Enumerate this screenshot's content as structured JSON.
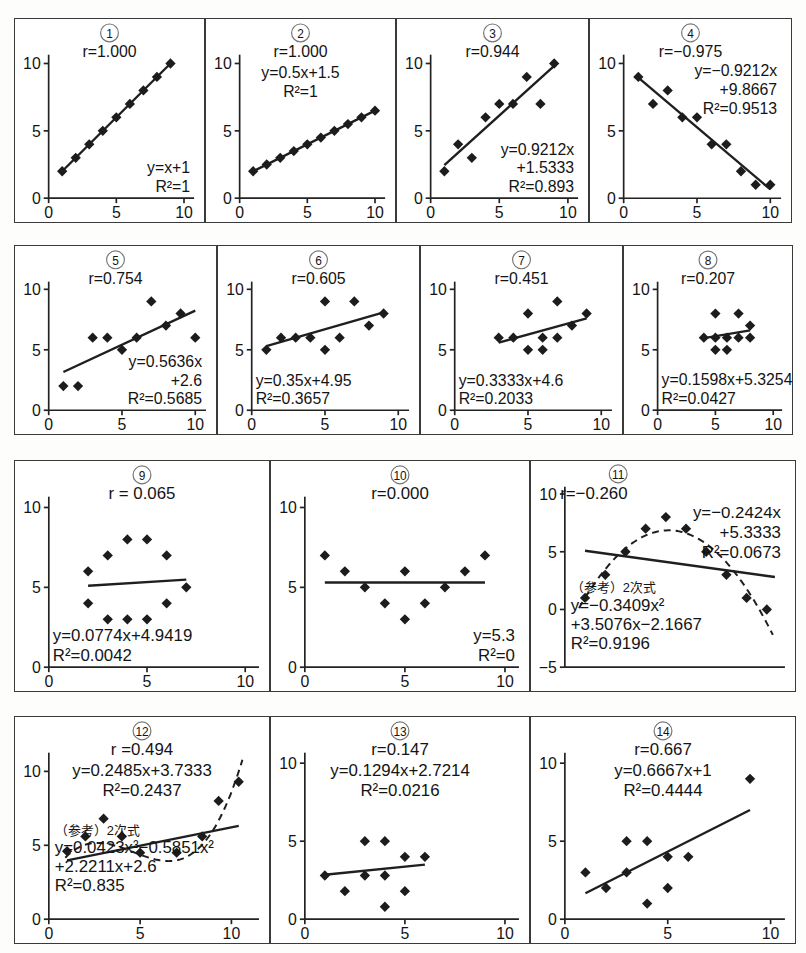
{
  "figure": {
    "point_color": "#1c1c1c",
    "line_color": "#1f1f1f",
    "axis_color": "#222222",
    "panel_border_color": "#3a3a3a",
    "background": "#ffffff",
    "axis_ticks_x": [
      "0",
      "5",
      "10"
    ],
    "axis_ticks_y": [
      "0",
      "5",
      "10"
    ],
    "axis_ticks_y_neg": [
      "-5",
      "0",
      "5",
      "10"
    ]
  },
  "rows": [
    {
      "top": 18,
      "height": 205,
      "panels": [
        0,
        1,
        2,
        3
      ]
    },
    {
      "top": 245,
      "height": 190,
      "panels": [
        4,
        5,
        6,
        7
      ]
    },
    {
      "top": 460,
      "height": 232,
      "panels": [
        8,
        9,
        10
      ]
    },
    {
      "top": 716,
      "height": 228,
      "panels": [
        11,
        12,
        13
      ]
    }
  ],
  "chart_data": [
    {
      "id": 1,
      "number_label": "①",
      "type": "scatter",
      "title": "r=1.000",
      "r": 1.0,
      "equation_lines": [
        "y=x+1",
        "R²=1"
      ],
      "equation_pos": "bottom-right",
      "title_pos": "top-center",
      "xlim": [
        0,
        10.6
      ],
      "ylim": [
        0,
        10.8
      ],
      "xlabel": "",
      "ylabel": "",
      "xticks": [
        0,
        5,
        10
      ],
      "yticks": [
        0,
        5,
        10
      ],
      "grid": false,
      "x": [
        1,
        2,
        3,
        4,
        5,
        6,
        7,
        8,
        9
      ],
      "y": [
        2,
        3,
        4,
        5,
        6,
        7,
        8,
        9,
        10
      ],
      "fit": {
        "kind": "linear",
        "slope": 1,
        "intercept": 1,
        "x0": 1,
        "x1": 9
      },
      "curve": null
    },
    {
      "id": 2,
      "number_label": "②",
      "type": "scatter",
      "title": "r=1.000",
      "r": 1.0,
      "equation_lines": [
        "y=0.5x+1.5",
        "R²=1"
      ],
      "equation_pos": "top-center-below",
      "title_pos": "top-center",
      "xlim": [
        0,
        10.6
      ],
      "ylim": [
        0,
        10.8
      ],
      "xlabel": "",
      "ylabel": "",
      "xticks": [
        0,
        5,
        10
      ],
      "yticks": [
        0,
        5,
        10
      ],
      "grid": false,
      "x": [
        1,
        2,
        3,
        4,
        5,
        6,
        7,
        8,
        9,
        10
      ],
      "y": [
        2,
        2.5,
        3,
        3.5,
        4,
        4.5,
        5,
        5.5,
        6,
        6.5
      ],
      "fit": {
        "kind": "linear",
        "slope": 0.5,
        "intercept": 1.5,
        "x0": 1,
        "x1": 10
      },
      "curve": null
    },
    {
      "id": 3,
      "number_label": "③",
      "type": "scatter",
      "title": "r=0.944",
      "r": 0.944,
      "equation_lines": [
        "y=0.9212x",
        "+1.5333",
        "R²=0.893"
      ],
      "equation_pos": "bottom-right",
      "title_pos": "top-center",
      "xlim": [
        0,
        10.6
      ],
      "ylim": [
        0,
        10.8
      ],
      "xlabel": "",
      "ylabel": "",
      "xticks": [
        0,
        5,
        10
      ],
      "yticks": [
        0,
        5,
        10
      ],
      "grid": false,
      "x": [
        1,
        2,
        3,
        4,
        5,
        6,
        7,
        8,
        9
      ],
      "y": [
        2,
        4,
        3,
        6,
        7,
        7,
        9,
        7,
        10
      ],
      "fit": {
        "kind": "linear",
        "slope": 0.9212,
        "intercept": 1.5333,
        "x0": 1,
        "x1": 9
      },
      "curve": null
    },
    {
      "id": 4,
      "number_label": "④",
      "type": "scatter",
      "title": "r=−0.975",
      "r": -0.975,
      "equation_lines": [
        "y=−0.9212x",
        "+9.8667",
        "R²=0.9513"
      ],
      "equation_pos": "top-right",
      "title_pos": "top-center",
      "xlim": [
        0,
        10.6
      ],
      "ylim": [
        0,
        10.8
      ],
      "xlabel": "",
      "ylabel": "",
      "xticks": [
        0,
        5,
        10
      ],
      "yticks": [
        0,
        5,
        10
      ],
      "grid": false,
      "x": [
        1,
        2,
        3,
        4,
        5,
        6,
        7,
        8,
        9,
        10
      ],
      "y": [
        9,
        7,
        8,
        6,
        6,
        4,
        4,
        2,
        1,
        1
      ],
      "fit": {
        "kind": "linear",
        "slope": -0.9212,
        "intercept": 9.8667,
        "x0": 1,
        "x1": 10
      },
      "curve": null
    },
    {
      "id": 5,
      "number_label": "⑤",
      "type": "scatter",
      "title": "r=0.754",
      "r": 0.754,
      "equation_lines": [
        "y=0.5636x",
        "+2.6",
        "R²=0.5685"
      ],
      "equation_pos": "bottom-right",
      "title_pos": "top-center",
      "xlim": [
        0,
        10.6
      ],
      "ylim": [
        0,
        10.8
      ],
      "xlabel": "",
      "ylabel": "",
      "xticks": [
        0,
        5,
        10
      ],
      "yticks": [
        0,
        5,
        10
      ],
      "grid": false,
      "x": [
        1,
        2,
        3,
        4,
        5,
        6,
        7,
        8,
        9,
        10
      ],
      "y": [
        2,
        2,
        6,
        6,
        5,
        6,
        9,
        7,
        8,
        6
      ],
      "fit": {
        "kind": "linear",
        "slope": 0.5636,
        "intercept": 2.6,
        "x0": 1,
        "x1": 10
      },
      "curve": null
    },
    {
      "id": 6,
      "number_label": "⑥",
      "type": "scatter",
      "title": "r=0.605",
      "r": 0.605,
      "equation_lines": [
        "y=0.35x+4.95",
        "R²=0.3657"
      ],
      "equation_pos": "bottom-left",
      "title_pos": "top-center",
      "xlim": [
        0,
        10.6
      ],
      "ylim": [
        0,
        10.8
      ],
      "xlabel": "",
      "ylabel": "",
      "xticks": [
        0,
        5,
        10
      ],
      "yticks": [
        0,
        5,
        10
      ],
      "grid": false,
      "x": [
        1,
        2,
        3,
        4,
        5,
        5,
        6,
        7,
        8,
        9
      ],
      "y": [
        5,
        6,
        6,
        6,
        9,
        5,
        6,
        9,
        7,
        8
      ],
      "fit": {
        "kind": "linear",
        "slope": 0.35,
        "intercept": 4.95,
        "x0": 1,
        "x1": 9
      },
      "curve": null
    },
    {
      "id": 7,
      "number_label": "⑦",
      "type": "scatter",
      "title": "r=0.451",
      "r": 0.451,
      "equation_lines": [
        "y=0.3333x+4.6",
        "R²=0.2033"
      ],
      "equation_pos": "bottom-left",
      "title_pos": "top-center",
      "xlim": [
        0,
        10.6
      ],
      "ylim": [
        0,
        10.8
      ],
      "xlabel": "",
      "ylabel": "",
      "xticks": [
        0,
        5,
        10
      ],
      "yticks": [
        0,
        5,
        10
      ],
      "grid": false,
      "x": [
        3,
        4,
        5,
        5,
        6,
        6,
        7,
        7,
        8,
        9
      ],
      "y": [
        6,
        6,
        8,
        5,
        6,
        5,
        9,
        6,
        7,
        8
      ],
      "fit": {
        "kind": "linear",
        "slope": 0.3333,
        "intercept": 4.6,
        "x0": 3,
        "x1": 9
      },
      "curve": null
    },
    {
      "id": 8,
      "number_label": "⑧",
      "type": "scatter",
      "title": "r=0.207",
      "r": 0.207,
      "equation_lines": [
        "y=0.1598x+5.3254",
        "R²=0.0427"
      ],
      "equation_pos": "bottom-left",
      "title_pos": "top-center",
      "xlim": [
        0,
        10.6
      ],
      "ylim": [
        0,
        10.8
      ],
      "xlabel": "",
      "ylabel": "",
      "xticks": [
        0,
        5,
        10
      ],
      "yticks": [
        0,
        5,
        10
      ],
      "grid": false,
      "x": [
        4,
        5,
        5,
        5,
        6,
        6,
        7,
        7,
        8,
        8
      ],
      "y": [
        6,
        8,
        6,
        5,
        6,
        5,
        8,
        6,
        7,
        6
      ],
      "fit": {
        "kind": "linear",
        "slope": 0.1598,
        "intercept": 5.3254,
        "x0": 4,
        "x1": 8
      },
      "curve": null
    },
    {
      "id": 9,
      "number_label": "⑨",
      "type": "scatter",
      "title": "r = 0.065",
      "r": 0.065,
      "equation_lines": [
        "y=0.0774x+4.9419",
        "R²=0.0042"
      ],
      "equation_pos": "bottom-left",
      "title_pos": "top-center",
      "xlim": [
        0,
        10.6
      ],
      "ylim": [
        0,
        10.8
      ],
      "xlabel": "",
      "ylabel": "",
      "xticks": [
        0,
        5,
        10
      ],
      "yticks": [
        0,
        5,
        10
      ],
      "grid": false,
      "x": [
        2,
        2,
        3,
        3,
        4,
        4,
        5,
        5,
        6,
        6,
        7
      ],
      "y": [
        6,
        4,
        7,
        3,
        8,
        3,
        8,
        3,
        7,
        4,
        5
      ],
      "fit": {
        "kind": "linear",
        "slope": 0.0774,
        "intercept": 4.9419,
        "x0": 2,
        "x1": 7
      },
      "curve": null
    },
    {
      "id": 10,
      "number_label": "⑩",
      "type": "scatter",
      "title": "r=0.000",
      "r": 0.0,
      "equation_lines": [
        "y=5.3",
        "R²=0"
      ],
      "equation_pos": "bottom-right",
      "title_pos": "top-center",
      "xlim": [
        0,
        10.6
      ],
      "ylim": [
        0,
        10.8
      ],
      "xlabel": "",
      "ylabel": "",
      "xticks": [
        0,
        5,
        10
      ],
      "yticks": [
        0,
        5,
        10
      ],
      "grid": false,
      "x": [
        1,
        2,
        3,
        4,
        5,
        5,
        6,
        7,
        8,
        9
      ],
      "y": [
        7,
        6,
        5,
        4,
        6,
        3,
        4,
        5,
        6,
        7
      ],
      "fit": {
        "kind": "linear",
        "slope": 0,
        "intercept": 5.3,
        "x0": 1,
        "x1": 9
      },
      "curve": null
    },
    {
      "id": 11,
      "number_label": "⑪",
      "type": "scatter",
      "title": "r=−0.260",
      "r": -0.26,
      "equation_lines": [
        "y=−0.2424x",
        "+5.3333",
        "R²=0.0673"
      ],
      "equation_pos": "top-right",
      "title_pos": "top-left",
      "note_lines": [
        "（参考）2次式",
        "y=−0.3409x²",
        "+3.5076x−2.1667",
        "R²=0.9196"
      ],
      "xlim": [
        0,
        10.8
      ],
      "ylim": [
        -5,
        10.8
      ],
      "xlabel": "",
      "ylabel": "",
      "xticks": [],
      "yticks": [
        -5,
        0,
        5,
        10
      ],
      "grid": false,
      "x": [
        1,
        2,
        3,
        4,
        5,
        6,
        7,
        8,
        9,
        10
      ],
      "y": [
        1,
        3,
        5,
        7,
        8,
        7,
        5,
        3,
        1,
        0
      ],
      "fit": {
        "kind": "linear",
        "slope": -0.2424,
        "intercept": 5.3333,
        "x0": 1,
        "x1": 10.4
      },
      "curve": {
        "kind": "quad",
        "a": -0.3409,
        "b": 3.5076,
        "c": -2.1667,
        "x0": 0.7,
        "x1": 10.3,
        "dashed": true
      }
    },
    {
      "id": 12,
      "number_label": "⑫",
      "type": "scatter",
      "title": "r =0.494",
      "r": 0.494,
      "equation_lines": [
        "y=0.2485x+3.7333",
        "R²=0.2437"
      ],
      "equation_pos": "top-center-below",
      "title_pos": "top-center",
      "note_lines": [
        "（参考）2次式",
        "y=0.0423x³−0.5851x²",
        "+2.2211x+2.6",
        "R²=0.835"
      ],
      "xlim": [
        0,
        11.4
      ],
      "ylim": [
        0,
        11.4
      ],
      "xlabel": "",
      "ylabel": "",
      "xticks": [
        0,
        5,
        10
      ],
      "yticks": [
        0,
        5,
        10
      ],
      "grid": false,
      "x": [
        1,
        2,
        3,
        4,
        5,
        7,
        8.4,
        9.3,
        10.4
      ],
      "y": [
        4.6,
        5.6,
        6.8,
        5.6,
        4.5,
        4.5,
        5.6,
        8,
        9.3
      ],
      "fit": {
        "kind": "linear",
        "slope": 0.2485,
        "intercept": 3.7333,
        "x0": 1,
        "x1": 10.4
      },
      "curve": {
        "kind": "cubic",
        "a": 0.0423,
        "b": -0.5851,
        "c": 2.2211,
        "d": 2.6,
        "x0": 0.9,
        "x1": 10.6,
        "dashed": true
      }
    },
    {
      "id": 13,
      "number_label": "⑬",
      "type": "scatter",
      "title": "r=0.147",
      "r": 0.147,
      "equation_lines": [
        "y=0.1294x+2.7214",
        "R²=0.0216"
      ],
      "equation_pos": "top-center-below",
      "title_pos": "top-center",
      "xlim": [
        0,
        10.6
      ],
      "ylim": [
        0,
        10.8
      ],
      "xlabel": "",
      "ylabel": "",
      "xticks": [
        0,
        5,
        10
      ],
      "yticks": [
        0,
        5,
        10
      ],
      "grid": false,
      "x": [
        1,
        2,
        3,
        3,
        4,
        4,
        4,
        5,
        5,
        6
      ],
      "y": [
        2.8,
        1.8,
        5,
        2.8,
        5,
        2.8,
        0.8,
        4,
        1.8,
        4
      ],
      "fit": {
        "kind": "linear",
        "slope": 0.1294,
        "intercept": 2.7214,
        "x0": 1,
        "x1": 6
      },
      "curve": null
    },
    {
      "id": 14,
      "number_label": "⑭",
      "type": "scatter",
      "title": "r=0.667",
      "r": 0.667,
      "equation_lines": [
        "y=0.6667x+1",
        "R²=0.4444"
      ],
      "equation_pos": "top-center-below",
      "title_pos": "top-center",
      "xlim": [
        0,
        10.6
      ],
      "ylim": [
        0,
        10.8
      ],
      "xlabel": "",
      "ylabel": "",
      "xticks": [
        0,
        5,
        10
      ],
      "yticks": [
        0,
        5,
        10
      ],
      "grid": false,
      "x": [
        1,
        2,
        3,
        3,
        4,
        4,
        5,
        5,
        6,
        9
      ],
      "y": [
        3,
        2,
        5,
        3,
        5,
        1,
        4,
        2,
        4,
        9
      ],
      "fit": {
        "kind": "linear",
        "slope": 0.6667,
        "intercept": 1,
        "x0": 1,
        "x1": 9
      },
      "curve": null
    }
  ]
}
